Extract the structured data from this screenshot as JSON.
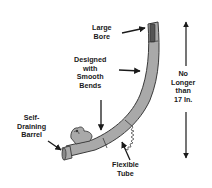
{
  "diagram": {
    "labels": {
      "large_bore": [
        "Large",
        "Bore"
      ],
      "smooth_bends": [
        "Designed",
        "with",
        "Smooth",
        "Bends"
      ],
      "length": [
        "No",
        "Longer",
        "than",
        "17 In."
      ],
      "self_draining": [
        "Self-",
        "Draining",
        "Barrel"
      ],
      "flexible_tube": [
        "Flexible",
        "Tube"
      ]
    },
    "colors": {
      "tube_fill": "#a9a9a9",
      "tube_stroke": "#3a3a3a",
      "arrow": "#1a1a1a",
      "text": "#1a1a1a",
      "background": "#ffffff"
    }
  }
}
